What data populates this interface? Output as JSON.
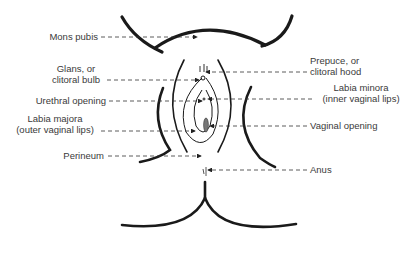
{
  "diagram": {
    "labels_left": [
      {
        "id": "mons-pubis",
        "lines": [
          "Mons pubis"
        ]
      },
      {
        "id": "glans",
        "lines": [
          "Glans, or",
          "clitoral bulb"
        ]
      },
      {
        "id": "urethral-opening",
        "lines": [
          "Urethral opening"
        ]
      },
      {
        "id": "labia-majora",
        "lines": [
          "Labia majora",
          "(outer vaginal lips)"
        ]
      },
      {
        "id": "perineum",
        "lines": [
          "Perineum"
        ]
      }
    ],
    "labels_right": [
      {
        "id": "prepuce",
        "lines": [
          "Prepuce, or",
          "clitoral hood"
        ]
      },
      {
        "id": "labia-minora",
        "lines": [
          "Labia minora",
          "(inner vaginal lips)"
        ]
      },
      {
        "id": "vaginal-opening",
        "lines": [
          "Vaginal opening"
        ]
      },
      {
        "id": "anus",
        "lines": [
          "Anus"
        ]
      }
    ],
    "colors": {
      "stroke": "#1a1a1a",
      "text": "#3a3a3a",
      "leader": "#333333"
    }
  }
}
